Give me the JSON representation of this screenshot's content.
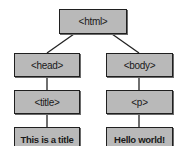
{
  "diagram": {
    "type": "DOM tree",
    "nodes": {
      "html": "<html>",
      "head": "<head>",
      "body": "<body>",
      "title": "<title>",
      "p": "<p>",
      "title_text": "This is a title",
      "p_text": "Hello world!"
    },
    "edges": [
      [
        "html",
        "head"
      ],
      [
        "html",
        "body"
      ],
      [
        "head",
        "title"
      ],
      [
        "body",
        "p"
      ],
      [
        "title",
        "title_text"
      ],
      [
        "p",
        "p_text"
      ]
    ],
    "colors": {
      "node_fill": "#b9b9b9",
      "node_border": "#1f1f1f",
      "edge": "#222222"
    }
  }
}
